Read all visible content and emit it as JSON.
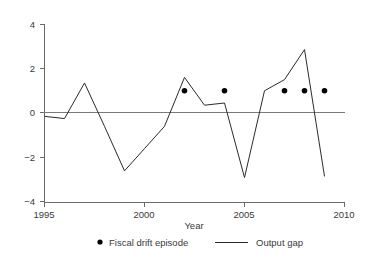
{
  "chart_data": {
    "type": "line",
    "title": "",
    "xlabel": "Year",
    "ylabel": "",
    "xlim": [
      1995,
      2010
    ],
    "ylim": [
      -4,
      4
    ],
    "xticks": [
      1995,
      2000,
      2005,
      2010
    ],
    "xtick_labels": [
      "1995",
      "2000",
      "2005",
      "2010"
    ],
    "yticks": [
      4,
      2,
      0,
      -2,
      -4
    ],
    "ytick_labels": [
      "4",
      "2",
      "0",
      "−2",
      "−4"
    ],
    "grid": false,
    "zero_line": true,
    "legend_position": "bottom-center",
    "x": [
      1995,
      1996,
      1997,
      1998,
      1999,
      2000,
      2001,
      2002,
      2003,
      2004,
      2005,
      2006,
      2007,
      2008,
      2009
    ],
    "series": [
      {
        "name": "Output gap",
        "type": "line",
        "color": "#2b2b2b",
        "values": [
          -0.15,
          -0.25,
          1.35,
          -0.6,
          -2.6,
          -1.6,
          -0.6,
          1.6,
          0.35,
          0.45,
          -2.9,
          1.0,
          1.5,
          2.85,
          -2.85
        ]
      },
      {
        "name": "Fiscal drift episode",
        "type": "scatter",
        "color": "#000000",
        "marker": "dot",
        "x": [
          2002,
          2004,
          2007,
          2008,
          2009
        ],
        "values": [
          1.0,
          1.0,
          1.0,
          1.0,
          1.0
        ]
      }
    ],
    "legend": [
      {
        "label": "Fiscal drift episode",
        "marker": "dot",
        "color": "#000000"
      },
      {
        "label": "Output gap",
        "marker": "line",
        "color": "#2b2b2b"
      }
    ]
  },
  "axes": {
    "x_axis_title": "Year",
    "x_tick_1995": "1995",
    "x_tick_2000": "2000",
    "x_tick_2005": "2005",
    "x_tick_2010": "2010",
    "y_tick_pos4": "4",
    "y_tick_pos2": "2",
    "y_tick_zero": "0",
    "y_tick_neg2": "−2",
    "y_tick_neg4": "−4"
  },
  "legend": {
    "fiscal_drift_label": "Fiscal drift episode",
    "output_gap_label": "Output gap"
  }
}
